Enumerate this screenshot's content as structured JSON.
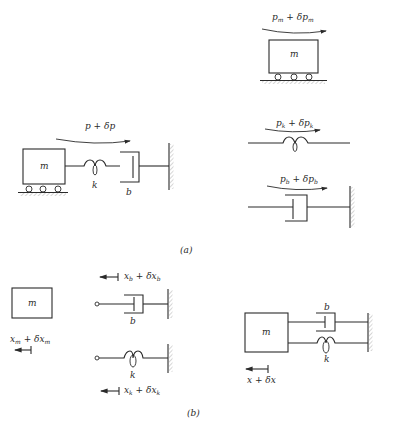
{
  "figure": {
    "part_a": {
      "caption": "(a)",
      "system": {
        "mass_label": "m",
        "spring_label": "k",
        "damper_label": "b",
        "force_label": "p + δp"
      },
      "free_bodies": {
        "mass": {
          "label": "m",
          "force_main": "p",
          "force_sub": "m",
          "force_plus": " + δ",
          "force_main2": "p",
          "force_sub2": "m"
        },
        "spring": {
          "force_main": "p",
          "force_sub": "k",
          "force_plus": " + δ",
          "force_main2": "p",
          "force_sub2": "k"
        },
        "damper": {
          "force_main": "p",
          "force_sub": "b",
          "force_plus": " + δ",
          "force_main2": "p",
          "force_sub2": "b"
        }
      }
    },
    "part_b": {
      "caption": "(b)",
      "mass": {
        "label": "m",
        "disp_main": "x",
        "disp_sub": "m",
        "disp_plus": " + δ",
        "disp_main2": "x",
        "disp_sub2": "m"
      },
      "damper": {
        "label": "b",
        "disp_main": "x",
        "disp_sub": "b",
        "disp_plus": " + δ",
        "disp_main2": "x",
        "disp_sub2": "b"
      },
      "spring": {
        "label": "k",
        "disp_main": "x",
        "disp_sub": "k",
        "disp_plus": " + δ",
        "disp_main2": "x",
        "disp_sub2": "k"
      },
      "combined": {
        "mass_label": "m",
        "damper_label": "b",
        "spring_label": "k",
        "disp_label": "x + δx"
      }
    }
  }
}
